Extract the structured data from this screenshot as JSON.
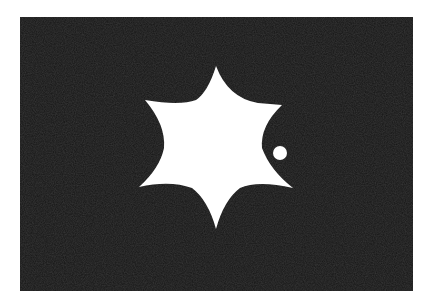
{
  "image": {
    "description": "White six-pointed star with concave sides and a small white dot on a dark textured rectangle",
    "colors": {
      "background": "#ffffff",
      "panel": "#151515",
      "shape": "#ffffff"
    },
    "star": {
      "points": 6,
      "tips": [
        [
          216,
          66
        ],
        [
          282,
          105
        ],
        [
          293,
          188
        ],
        [
          216,
          229
        ],
        [
          139,
          187
        ],
        [
          145,
          100
        ]
      ],
      "center": [
        216,
        148
      ]
    },
    "dot": {
      "cx": 280,
      "cy": 153,
      "r": 7
    }
  }
}
